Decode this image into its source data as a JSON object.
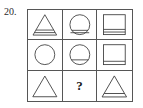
{
  "problem": {
    "number_label": "20.",
    "missing_marker": "?"
  },
  "style": {
    "stroke_color": "#565656",
    "figure_stroke": "#3a3a3a",
    "background": "#ffffff",
    "text_color": "#2b2b2b"
  },
  "matrix": {
    "rows": 3,
    "columns": 3,
    "cells": [
      {
        "position": "row1-col1",
        "shape": "triangle",
        "band": "thick",
        "band_lines": 2,
        "label": "triangle-with-thick-band"
      },
      {
        "position": "row1-col2",
        "shape": "circle",
        "band": "thick",
        "band_lines": 2,
        "label": "circle-with-thick-band"
      },
      {
        "position": "row1-col3",
        "shape": "square",
        "band": "thick",
        "band_lines": 2,
        "label": "square-with-thick-band"
      },
      {
        "position": "row2-col1",
        "shape": "circle",
        "band": "none",
        "band_lines": 0,
        "label": "plain-circle"
      },
      {
        "position": "row2-col2",
        "shape": "circle",
        "band": "thin",
        "band_lines": 1,
        "label": "circle-with-thin-band"
      },
      {
        "position": "row2-col3",
        "shape": "square",
        "band": "thin",
        "band_lines": 1,
        "label": "square-with-thin-band"
      },
      {
        "position": "row3-col1",
        "shape": "triangle",
        "band": "none",
        "band_lines": 0,
        "label": "plain-triangle"
      },
      {
        "position": "row3-col2",
        "shape": "question",
        "band": "none",
        "band_lines": 0,
        "label": "missing-answer-cell"
      },
      {
        "position": "row3-col3",
        "shape": "triangle",
        "band": "thin",
        "band_lines": 1,
        "label": "triangle-with-thin-band"
      }
    ]
  }
}
